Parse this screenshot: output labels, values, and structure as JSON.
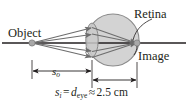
{
  "figure": {
    "labels": {
      "object": "Object",
      "retina": "Retina",
      "image": "Image",
      "object_distance": "s",
      "object_distance_sub": "o"
    },
    "equation": {
      "image_distance_symbol": "s",
      "image_distance_sub": "i",
      "equals": "=",
      "eye_diameter_symbol": "d",
      "eye_diameter_sub": "eye",
      "approx": "≈",
      "value": "2.5",
      "unit": "cm",
      "full_text": "s_i = d_eye ≈ 2.5 cm"
    },
    "colors": {
      "eyeball_fill": "#d3d3d3",
      "eyeball_stroke": "#8a8a8a",
      "lens_fill": "#c9c9c9",
      "lens_stroke": "#8a8a8a",
      "axis": "#231f20",
      "ray": "#6d6d6d",
      "point": "#9a9a9a",
      "dimension": "#231f20",
      "text": "#231f20",
      "background": "#ffffff"
    },
    "geometry": {
      "eyeball_center_x": 113,
      "eyeball_center_y": 40,
      "eyeball_radius": 26,
      "lens_center_x": 92,
      "lens_center_y": 40,
      "lens_rx": 6,
      "lens_ry": 17,
      "object_point_x": 32,
      "object_point_y": 43,
      "image_point_x": 137,
      "image_point_y": 43,
      "axis_y": 43,
      "axis_x1": 2,
      "axis_x2": 186
    },
    "dimension_lines": {
      "object_distance": {
        "x1": 32,
        "x2": 92,
        "y": 71
      },
      "image_distance": {
        "x1": 92,
        "x2": 137,
        "y": 80
      }
    }
  }
}
